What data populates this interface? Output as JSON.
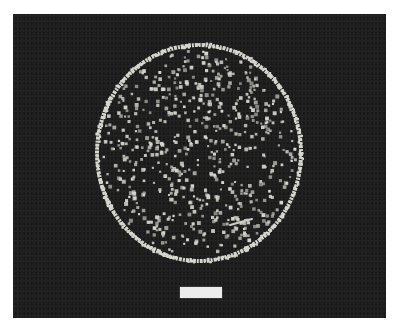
{
  "image": {
    "subject": "circular dish of scattered bright particles on dark background",
    "background_color": "#ffffff",
    "frame": {
      "left": 13,
      "top": 14,
      "width": 373,
      "height": 304,
      "color": "#202020"
    },
    "dish": {
      "cx": 186,
      "cy": 139,
      "rx": 102,
      "ry": 108,
      "rim_color": "#d6d6ce",
      "rim_width": 4,
      "particle_color": "#d8d8d0",
      "particle_count": 620,
      "particle_size_min": 2,
      "particle_size_max": 4,
      "seed": 7
    },
    "scratch": {
      "x1": 230,
      "y1": 225,
      "x2": 252,
      "y2": 219,
      "color": "#cfcfc8"
    },
    "scale_bar": {
      "left": 180,
      "top": 287,
      "width": 42,
      "height": 11,
      "color": "#ececec"
    }
  }
}
